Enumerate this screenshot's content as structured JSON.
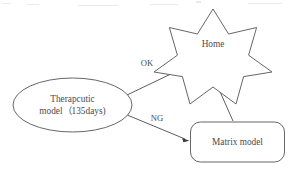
{
  "diagram": {
    "type": "flow-diagram",
    "background_color": "#ffffff",
    "stroke_color": "#55555a",
    "text_color": "#4a4a50",
    "nodes": [
      {
        "id": "therapeutic",
        "shape": "ellipse",
        "line1": "Therapcutic",
        "line2": "model（135days)"
      },
      {
        "id": "home",
        "shape": "star",
        "points": 7,
        "label": "Home"
      },
      {
        "id": "matrix",
        "shape": "rounded-rectangle",
        "label": "Matrix model"
      }
    ],
    "edges": [
      {
        "id": "ok",
        "from": "therapeutic",
        "to": "home",
        "label": "OK",
        "arrow": "single"
      },
      {
        "id": "ng",
        "from": "therapeutic",
        "to": "matrix",
        "label": "NG",
        "arrow": "single"
      },
      {
        "id": "matrix-to-home",
        "from": "matrix",
        "to": "home",
        "label": "",
        "arrow": "single"
      }
    ]
  }
}
